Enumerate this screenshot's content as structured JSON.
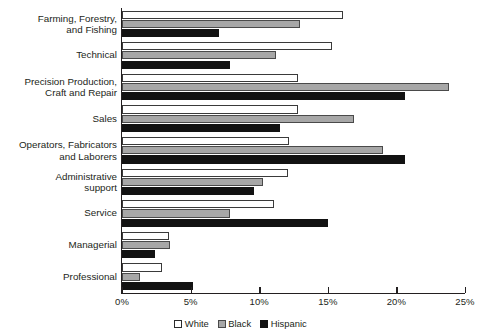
{
  "chart_data": {
    "type": "bar",
    "orientation": "horizontal",
    "title": "",
    "subtitle": "",
    "xlabel": "",
    "ylabel": "",
    "xlim": [
      0,
      25
    ],
    "xunit": "%",
    "grid": false,
    "legend_position": "bottom-center",
    "categories": [
      "Farming, Forestry,\nand Fishing",
      "Technical",
      "Precision Production,\nCraft and Repair",
      "Sales",
      "Operators, Fabricators\nand Laborers",
      "Administrative\nsupport",
      "Service",
      "Managerial",
      "Professional"
    ],
    "tick_labels": [
      "0%",
      "5%",
      "10%",
      "15%",
      "20%",
      "25%"
    ],
    "tick_values": [
      0,
      5,
      10,
      15,
      20,
      25
    ],
    "series": [
      {
        "name": "White",
        "style": "outline",
        "color": "#ffffff",
        "border": "#3a3a3a",
        "values": [
          16.1,
          15.3,
          12.8,
          12.8,
          12.2,
          12.1,
          11.1,
          3.4,
          2.9
        ]
      },
      {
        "name": "Black",
        "style": "gray",
        "color": "#a7a7a7",
        "border": "#4a4a4a",
        "values": [
          13.0,
          11.2,
          23.8,
          16.9,
          19.0,
          10.3,
          7.9,
          3.5,
          1.3
        ]
      },
      {
        "name": "Hispanic",
        "style": "solid",
        "color": "#121212",
        "border": "#121212",
        "values": [
          7.1,
          7.9,
          20.6,
          11.5,
          20.6,
          9.6,
          15.0,
          2.4,
          5.2
        ]
      }
    ]
  },
  "legend": {
    "items": [
      {
        "label": "White"
      },
      {
        "label": "Black"
      },
      {
        "label": "Hispanic"
      }
    ]
  }
}
